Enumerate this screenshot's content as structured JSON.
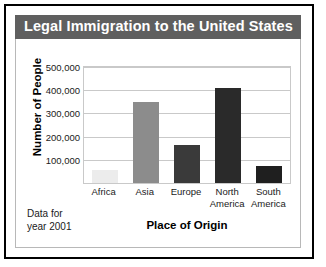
{
  "figure": {
    "title": "Legal Immigration to the United States",
    "footnote_line1": "Data for",
    "footnote_line2": "year 2001",
    "title_bar_color": "#5f5f5f",
    "title_text_color": "#ffffff",
    "border_color": "#000000",
    "grid_color": "#c9c9c9"
  },
  "chart_data": {
    "type": "bar",
    "title": "Legal Immigration to the United States",
    "xlabel": "Place of Origin",
    "ylabel": "Number of People",
    "categories": [
      "Africa",
      "Asia",
      "Europe",
      "North America",
      "South America"
    ],
    "values": [
      55000,
      350000,
      165000,
      410000,
      75000
    ],
    "colors": [
      "#ececec",
      "#8c8c8c",
      "#3a3a3a",
      "#2a2a2a",
      "#1f1f1f"
    ],
    "ylim": [
      0,
      500000
    ],
    "yticks": [
      100000,
      200000,
      300000,
      400000,
      500000
    ],
    "ytick_labels": [
      "100,000",
      "200,000",
      "300,000",
      "400,000",
      "500,000"
    ],
    "grid": true,
    "legend": "none",
    "annotation": "Data for year 2001"
  }
}
